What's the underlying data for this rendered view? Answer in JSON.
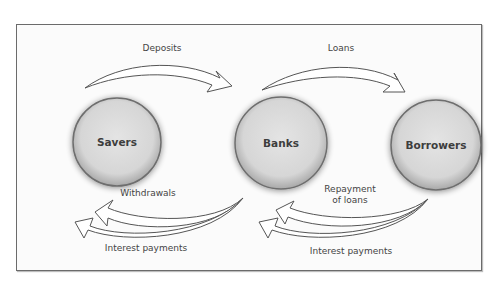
{
  "diagram": {
    "nodes": [
      {
        "id": "savers",
        "label": "Savers"
      },
      {
        "id": "banks",
        "label": "Banks"
      },
      {
        "id": "borrowers",
        "label": "Borrowers"
      }
    ],
    "flows": {
      "deposits": "Deposits",
      "loans": "Loans",
      "withdrawals": "Withdrawals",
      "interest_payments_left": "Interest payments",
      "repayment_line1": "Repayment",
      "repayment_line2": "of loans",
      "interest_payments_right": "Interest payments"
    },
    "colors": {
      "circle_fill": "#d9d9d9",
      "circle_stroke": "#6e6e6e",
      "arrow_fill": "#ffffff",
      "arrow_stroke": "#555555",
      "frame_border": "#6b6b6b"
    }
  }
}
